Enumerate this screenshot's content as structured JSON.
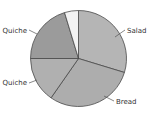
{
  "chart_data": {
    "type": "pie",
    "title": "",
    "start_angle_deg": 0,
    "direction": "clockwise",
    "slices": [
      {
        "label": "Salad",
        "value": 29.7,
        "color": "#b5b5b5",
        "label_x": 127,
        "label_y": 33,
        "label_anchor": "start",
        "leader": [
          115,
          37,
          125,
          30
        ]
      },
      {
        "label": "Bread",
        "value": 30.0,
        "color": "#adadad",
        "label_x": 116,
        "label_y": 104,
        "label_anchor": "start",
        "leader": [
          104,
          96,
          114,
          101
        ]
      },
      {
        "label": "Quiche",
        "value": 15.3,
        "color": "#b0b0b0",
        "label_x": 27,
        "label_y": 85,
        "label_anchor": "end",
        "leader": [
          29,
          83,
          37,
          80
        ]
      },
      {
        "label": "Quiche",
        "value": 20.3,
        "color": "#9b9b9b",
        "label_x": 27,
        "label_y": 33,
        "label_anchor": "end",
        "leader": [
          29,
          30,
          37,
          34
        ]
      },
      {
        "label": "",
        "value": 4.7,
        "color": "#f3f3f3",
        "label_x": null,
        "label_y": null,
        "label_anchor": "start",
        "leader": null
      }
    ],
    "center": [
      78.5,
      58.5
    ],
    "radius": 48,
    "legend": "none",
    "grid": false
  }
}
